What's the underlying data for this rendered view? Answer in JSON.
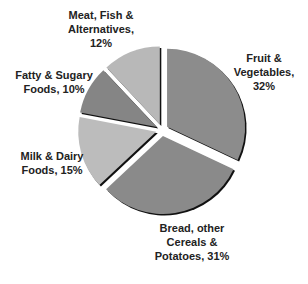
{
  "chart_data": {
    "type": "pie",
    "title": "",
    "center": [
      162,
      130
    ],
    "radius": 78,
    "explode": 6,
    "start_angle_deg": 0,
    "direction": "clockwise",
    "slices": [
      {
        "name": "Fruit & Vegetables",
        "value": 32,
        "color": "#8c8c8c",
        "label_lines": [
          "Fruit &",
          "Vegetables,",
          "32%"
        ],
        "label_pos": [
          264,
          62
        ]
      },
      {
        "name": "Bread, other Cereals & Potatoes",
        "value": 31,
        "color": "#8a8a8a",
        "label_lines": [
          "Bread, other",
          "Cereals &",
          "Potatoes, 31%"
        ],
        "label_pos": [
          192,
          232
        ]
      },
      {
        "name": "Milk & Dairy Foods",
        "value": 15,
        "color": "#bcbcbc",
        "label_lines": [
          "Milk & Dairy",
          "Foods, 15%"
        ],
        "label_pos": [
          52,
          160
        ]
      },
      {
        "name": "Fatty & Sugary Foods",
        "value": 10,
        "color": "#858585",
        "label_lines": [
          "Fatty & Sugary",
          "Foods, 10%"
        ],
        "label_pos": [
          54,
          79
        ]
      },
      {
        "name": "Meat, Fish & Alternatives",
        "value": 12,
        "color": "#b8b8b8",
        "label_lines": [
          "Meat, Fish &",
          "Alternatives,",
          "12%"
        ],
        "label_pos": [
          101,
          19
        ]
      }
    ]
  }
}
